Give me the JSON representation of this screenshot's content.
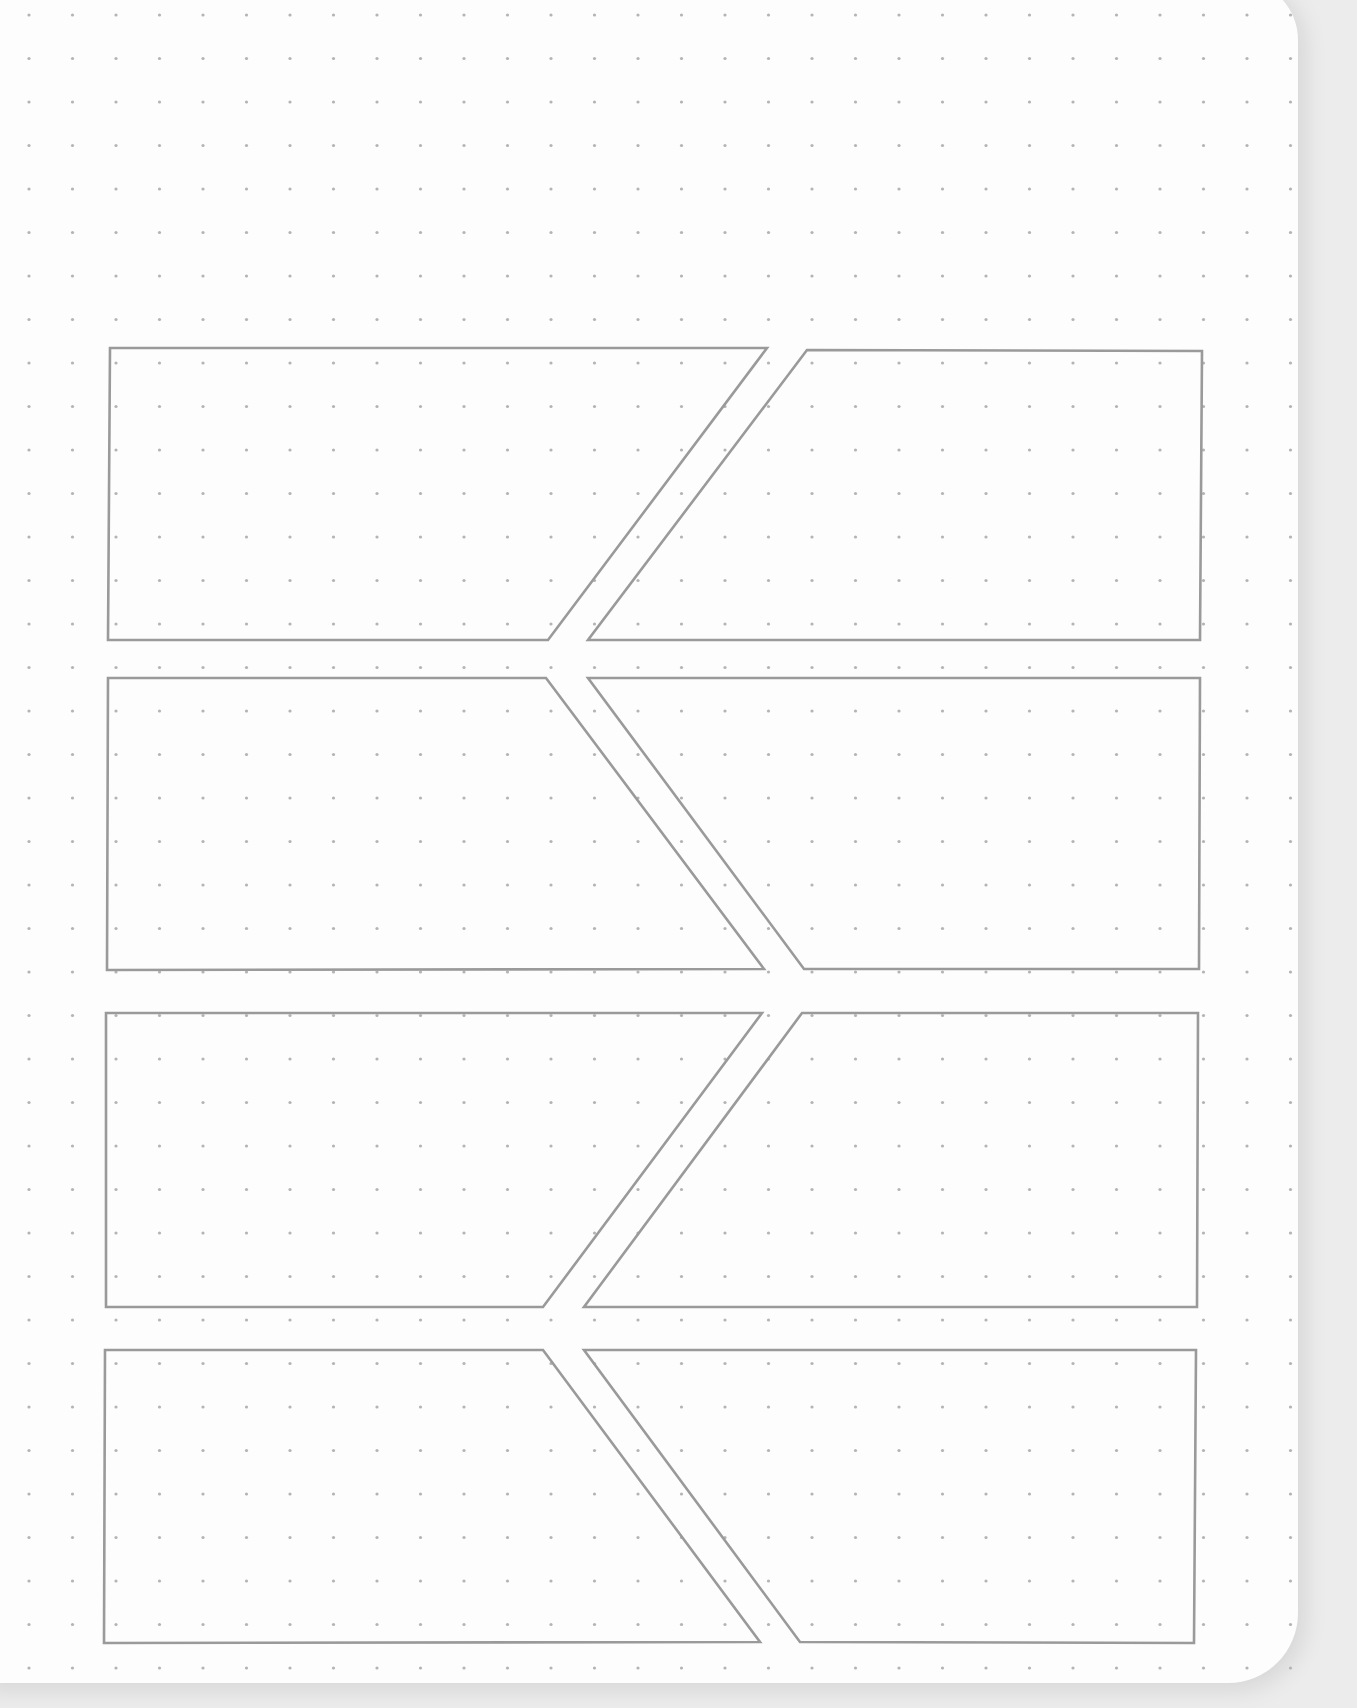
{
  "page": {
    "type": "dot-grid notebook page",
    "width": 1357,
    "height": 1708,
    "paper_color": "#fdfdfd",
    "background_color": "#ececec"
  },
  "dot_grid": {
    "origin_x": 29,
    "origin_y": 15,
    "spacing": 43.5,
    "dot_radius": 1.6,
    "dot_color": "#b4b4b4",
    "max_x": 1320,
    "max_y": 1690
  },
  "panel_style": {
    "stroke_color": "#9a9a9a",
    "stroke_width": 2.6
  },
  "panels": [
    {
      "id": "row1-left",
      "points": [
        [
          110,
          348
        ],
        [
          767,
          348
        ],
        [
          548,
          640
        ],
        [
          108,
          640
        ]
      ]
    },
    {
      "id": "row1-right",
      "points": [
        [
          807,
          350
        ],
        [
          1202,
          351
        ],
        [
          1200,
          640
        ],
        [
          588,
          640
        ]
      ]
    },
    {
      "id": "row2-left",
      "points": [
        [
          108,
          678
        ],
        [
          546,
          678
        ],
        [
          764,
          969
        ],
        [
          107,
          970
        ]
      ]
    },
    {
      "id": "row2-right",
      "points": [
        [
          588,
          678
        ],
        [
          1200,
          678
        ],
        [
          1199,
          969
        ],
        [
          804,
          969
        ]
      ]
    },
    {
      "id": "row3-left",
      "points": [
        [
          106,
          1013
        ],
        [
          762,
          1013
        ],
        [
          543,
          1307
        ],
        [
          106,
          1307
        ]
      ]
    },
    {
      "id": "row3-right",
      "points": [
        [
          802,
          1013
        ],
        [
          1198,
          1013
        ],
        [
          1197,
          1307
        ],
        [
          584,
          1307
        ]
      ]
    },
    {
      "id": "row4-left",
      "points": [
        [
          105,
          1350
        ],
        [
          543,
          1350
        ],
        [
          760,
          1642
        ],
        [
          104,
          1643
        ]
      ]
    },
    {
      "id": "row4-right",
      "points": [
        [
          584,
          1350
        ],
        [
          1196,
          1350
        ],
        [
          1194,
          1643
        ],
        [
          800,
          1642
        ]
      ]
    }
  ]
}
